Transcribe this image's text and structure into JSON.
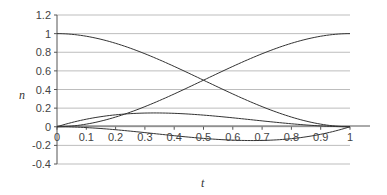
{
  "chart_data": {
    "type": "line",
    "title": "",
    "xlabel": "t",
    "ylabel": "n",
    "xlim": [
      0,
      1
    ],
    "ylim": [
      -0.4,
      1.2
    ],
    "grid": true,
    "legend": "none",
    "x_ticks": [
      "0",
      "0.1",
      "0.2",
      "0.3",
      "0.4",
      "0.5",
      "0.6",
      "0.7",
      "0.8",
      "0.9",
      "1"
    ],
    "y_ticks": [
      "1.2",
      "1",
      "0.8",
      "0.6",
      "0.4",
      "0.2",
      "0",
      "-0.2",
      "-0.4"
    ],
    "x": [
      0,
      0.1,
      0.2,
      0.3,
      0.4,
      0.5,
      0.6,
      0.7,
      0.8,
      0.9,
      1
    ],
    "series": [
      {
        "name": "h00",
        "values": [
          1,
          0.972,
          0.896,
          0.784,
          0.648,
          0.5,
          0.352,
          0.216,
          0.104,
          0.028,
          0
        ]
      },
      {
        "name": "h01",
        "values": [
          0,
          0.028,
          0.104,
          0.216,
          0.352,
          0.5,
          0.648,
          0.784,
          0.896,
          0.972,
          1
        ]
      },
      {
        "name": "h10",
        "values": [
          0,
          0.081,
          0.128,
          0.147,
          0.144,
          0.125,
          0.096,
          0.063,
          0.032,
          0.009,
          0
        ]
      },
      {
        "name": "h11",
        "values": [
          0,
          -0.009,
          -0.032,
          -0.063,
          -0.096,
          -0.125,
          -0.144,
          -0.147,
          -0.128,
          -0.081,
          0
        ]
      }
    ]
  }
}
